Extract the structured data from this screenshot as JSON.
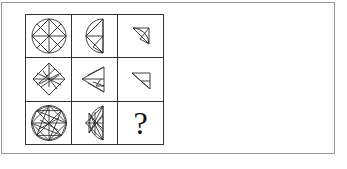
{
  "puzzle": {
    "type": "visual-analogy-matrix",
    "rows": 3,
    "columns": 3,
    "stroke_color": "#2b2b2b",
    "frame_color": "#9a9a9a",
    "background_color": "#ffffff",
    "missing_cell": "row3-col3",
    "cells": [
      {
        "id": "row1-col1",
        "shape_name": "circle-with-inscribed-diamond-and-cross",
        "description": "Circle containing an inscribed diamond plus horizontal and vertical diameters",
        "line_count": 4
      },
      {
        "id": "row1-col2",
        "shape_name": "left-semicircle-with-triangles",
        "description": "Semicircle bulging left with flat edge at right, divided by chords into triangles",
        "line_count": 4
      },
      {
        "id": "row1-col3",
        "shape_name": "quarter-circle-with-diagonals",
        "description": "Quarter circle wedge with internal diagonal lines",
        "line_count": 3
      },
      {
        "id": "row2-col1",
        "shape_name": "diamond-with-internal-lines",
        "description": "Diamond (rotated square) with internal crossing chords",
        "line_count": 6
      },
      {
        "id": "row2-col2",
        "shape_name": "left-pointing-triangle-with-lines",
        "description": "Triangle pointing left with internal chords",
        "line_count": 4
      },
      {
        "id": "row2-col3",
        "shape_name": "small-right-triangle",
        "description": "Small right triangle with a single internal line",
        "line_count": 2
      },
      {
        "id": "row3-col1",
        "shape_name": "circle-with-dense-star-lattice",
        "description": "Circle filled with a dense lattice of crossing chords forming a star pattern",
        "line_count": 14
      },
      {
        "id": "row3-col2",
        "shape_name": "left-semicircle-with-dense-lattice",
        "description": "Left-bulging semicircle filled with a dense lattice of crossing chords",
        "line_count": 11
      },
      {
        "id": "row3-col3",
        "shape_name": "question-mark",
        "description": "Missing element placeholder",
        "label": "?"
      }
    ]
  }
}
